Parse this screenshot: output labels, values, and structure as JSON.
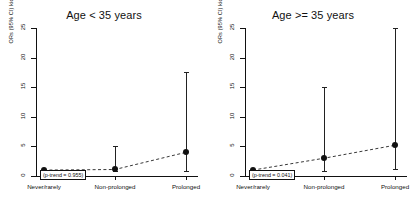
{
  "figure": {
    "background": "#ffffff",
    "point_color": "#111111",
    "line_color": "#222222"
  },
  "chart_data": {
    "type": "line",
    "title": "",
    "xlabel": "",
    "ylabel": "ORs (95% CI) kidney diseases",
    "ylim": [
      0,
      25
    ],
    "yticks": [
      0,
      5,
      10,
      15,
      20,
      25
    ],
    "ytick_labels": [
      "0",
      "5",
      "10",
      "15",
      "20",
      "25"
    ],
    "grid": false,
    "legend": "none",
    "categories": [
      "Never/rarely",
      "Non-prolonged",
      "Prolonged"
    ],
    "panels": [
      {
        "title": "Age < 35 years",
        "annotation": "(p-trend = 0.955)",
        "p_trend": 0.955,
        "series": [
          {
            "name": "ORs (95% CI) kidney diseases",
            "values": [
              1.0,
              1.1,
              4.0
            ],
            "ci_low": [
              1.0,
              0.85,
              0.85
            ],
            "ci_high": [
              1.0,
              5.0,
              17.5
            ]
          }
        ]
      },
      {
        "title": "Age >= 35 years",
        "annotation": "(p-trend = 0.041)",
        "p_trend": 0.041,
        "series": [
          {
            "name": "ORs (95% CI) kidney diseases",
            "values": [
              1.0,
              3.0,
              5.2
            ],
            "ci_low": [
              1.0,
              0.9,
              1.2
            ],
            "ci_high": [
              1.0,
              15.0,
              25.0
            ]
          }
        ]
      }
    ]
  }
}
